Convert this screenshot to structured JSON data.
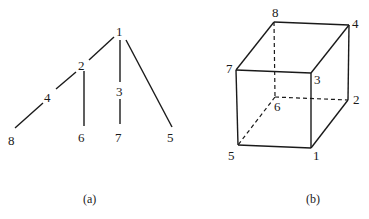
{
  "diagram_a": {
    "caption": "(a)",
    "type": "tree",
    "nodes": [
      {
        "id": "1",
        "label": "1"
      },
      {
        "id": "2",
        "label": "2"
      },
      {
        "id": "3",
        "label": "3"
      },
      {
        "id": "4",
        "label": "4"
      },
      {
        "id": "5",
        "label": "5"
      },
      {
        "id": "6",
        "label": "6"
      },
      {
        "id": "7",
        "label": "7"
      },
      {
        "id": "8",
        "label": "8"
      }
    ],
    "edges": [
      [
        "1",
        "2"
      ],
      [
        "1",
        "3"
      ],
      [
        "1",
        "5"
      ],
      [
        "2",
        "4"
      ],
      [
        "2",
        "6"
      ],
      [
        "3",
        "7"
      ],
      [
        "4",
        "8"
      ]
    ]
  },
  "diagram_b": {
    "caption": "(b)",
    "type": "cube",
    "nodes": [
      {
        "id": "1",
        "label": "1"
      },
      {
        "id": "2",
        "label": "2"
      },
      {
        "id": "3",
        "label": "3"
      },
      {
        "id": "4",
        "label": "4"
      },
      {
        "id": "5",
        "label": "5"
      },
      {
        "id": "6",
        "label": "6"
      },
      {
        "id": "7",
        "label": "7"
      },
      {
        "id": "8",
        "label": "8"
      }
    ],
    "solid_edges": [
      [
        "7",
        "3"
      ],
      [
        "3",
        "1"
      ],
      [
        "1",
        "5"
      ],
      [
        "5",
        "7"
      ],
      [
        "7",
        "8"
      ],
      [
        "8",
        "4"
      ],
      [
        "4",
        "3"
      ],
      [
        "4",
        "2"
      ],
      [
        "2",
        "1"
      ]
    ],
    "dashed_edges": [
      [
        "8",
        "6"
      ],
      [
        "6",
        "2"
      ],
      [
        "6",
        "5"
      ]
    ]
  }
}
